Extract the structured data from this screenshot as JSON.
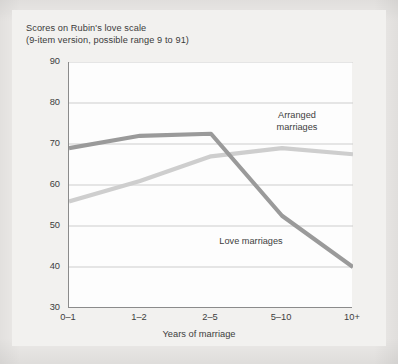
{
  "figure": {
    "title_line1": "Scores on Rubin's love scale",
    "title_line2": "(9-item version, possible range 9 to 91)",
    "title": "Scores on Rubin's love scale\n(9-item version, possible range 9 to 91)"
  },
  "chart_data": {
    "type": "line",
    "title": "Scores on Rubin's love scale (9-item version, possible range 9 to 91)",
    "xlabel": "Years of marriage",
    "ylabel": "",
    "categories": [
      "0–1",
      "1–2",
      "2–5",
      "5–10",
      "10+"
    ],
    "ylim": [
      30,
      90
    ],
    "yticks": [
      30,
      40,
      50,
      60,
      70,
      80,
      90
    ],
    "ytick_labels": [
      "30",
      "40",
      "50",
      "60",
      "70",
      "80",
      "90"
    ],
    "grid": "horizontal",
    "legend_position": "inline-annotations",
    "series": [
      {
        "name": "Arranged marriages",
        "label": "Arranged\nmarriages",
        "color": "#9a9a9a",
        "values": [
          69,
          72,
          72.5,
          52.5,
          40
        ]
      },
      {
        "name": "Love marriages",
        "label": "Love marriages",
        "color": "#cecece",
        "values": [
          56,
          61,
          67,
          69,
          67.5
        ]
      }
    ],
    "annotations": [
      {
        "text": "Arranged\nmarriages",
        "series": "Arranged marriages"
      },
      {
        "text": "Love marriages",
        "series": "Love marriages"
      }
    ]
  },
  "colors": {
    "page_background": "#eceae8",
    "card_background": "#f2f1ef",
    "plot_background": "#fdfdfd",
    "axis": "#8b8b8b",
    "gridline": "#cdcdcd",
    "text": "#3d3d3d",
    "series_dark": "#9a9a9a",
    "series_light": "#cecece"
  }
}
